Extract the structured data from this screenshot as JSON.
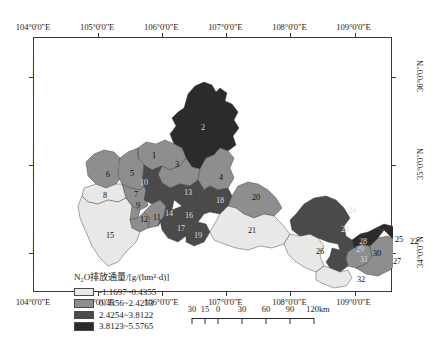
{
  "figure": {
    "domain": "map",
    "title_visible": false
  },
  "axes": {
    "longitude_labels": [
      "104°0'0\"E",
      "105°0'0\"E",
      "106°0'0\"E",
      "107°0'0\"E",
      "108°0'0\"E",
      "109°0'0\"E"
    ],
    "longitude_values": [
      104,
      105,
      106,
      107,
      108,
      109
    ],
    "latitude_labels": [
      "36°0'0\"N",
      "35°0'0\"N",
      "34°0'0\"N"
    ],
    "latitude_values": [
      36,
      35,
      34
    ],
    "lon_range": [
      103.75,
      109.35
    ],
    "lat_range": [
      33.55,
      36.45
    ]
  },
  "legend": {
    "title": "N₂O排放通量/[g/(hm²·d)]",
    "title_parts": {
      "species": "N2O",
      "quantity": "排放通量",
      "unit": "g/(hm2·d)"
    },
    "classes": [
      {
        "label": "-1.1697~0.4355",
        "min": -1.1697,
        "max": 0.4355,
        "color": "#e8e8e6"
      },
      {
        "label": "0.4356~2.4253",
        "min": 0.4356,
        "max": 2.4253,
        "color": "#8e8e8e"
      },
      {
        "label": "2.4254~3.8122",
        "min": 2.4254,
        "max": 3.8122,
        "color": "#4a4a4a"
      },
      {
        "label": "3.8123~5.5765",
        "min": 3.8123,
        "max": 5.5765,
        "color": "#2b2b2b"
      }
    ]
  },
  "scalebar": {
    "labels": [
      "30",
      "15",
      "0",
      "30",
      "60",
      "90",
      "120km"
    ],
    "values": [
      30,
      15,
      0,
      30,
      60,
      90,
      120
    ],
    "unit": "km"
  },
  "regions": [
    {
      "id": 1,
      "label": "1",
      "class": 1,
      "x": 120,
      "y": 118
    },
    {
      "id": 2,
      "label": "2",
      "class": 3,
      "x": 169,
      "y": 90
    },
    {
      "id": 3,
      "label": "3",
      "class": 1,
      "x": 143,
      "y": 127
    },
    {
      "id": 4,
      "label": "4",
      "class": 1,
      "x": 187,
      "y": 140
    },
    {
      "id": 5,
      "label": "5",
      "class": 1,
      "x": 98,
      "y": 136
    },
    {
      "id": 6,
      "label": "6",
      "class": 1,
      "x": 74,
      "y": 137
    },
    {
      "id": 7,
      "label": "7",
      "class": 1,
      "x": 102,
      "y": 157
    },
    {
      "id": 8,
      "label": "8",
      "class": 0,
      "x": 71,
      "y": 158
    },
    {
      "id": 9,
      "label": "9",
      "class": 1,
      "x": 104,
      "y": 168
    },
    {
      "id": 10,
      "label": "10",
      "class": 2,
      "x": 110,
      "y": 145
    },
    {
      "id": 11,
      "label": "11",
      "class": 1,
      "x": 123,
      "y": 180
    },
    {
      "id": 12,
      "label": "12",
      "class": 1,
      "x": 110,
      "y": 182
    },
    {
      "id": 13,
      "label": "13",
      "class": 2,
      "x": 154,
      "y": 155
    },
    {
      "id": 14,
      "label": "14",
      "class": 2,
      "x": 135,
      "y": 176
    },
    {
      "id": 15,
      "label": "15",
      "class": 0,
      "x": 76,
      "y": 198
    },
    {
      "id": 16,
      "label": "16",
      "class": 2,
      "x": 155,
      "y": 178
    },
    {
      "id": 17,
      "label": "17",
      "class": 2,
      "x": 147,
      "y": 191
    },
    {
      "id": 18,
      "label": "18",
      "class": 2,
      "x": 186,
      "y": 163
    },
    {
      "id": 19,
      "label": "19",
      "class": 2,
      "x": 164,
      "y": 198
    },
    {
      "id": 20,
      "label": "20",
      "class": 1,
      "x": 222,
      "y": 160
    },
    {
      "id": 21,
      "label": "21",
      "class": 0,
      "x": 218,
      "y": 193
    },
    {
      "id": 22,
      "label": "22",
      "class": 3,
      "x": 380,
      "y": 204
    },
    {
      "id": 23,
      "label": "23",
      "class": 2,
      "x": 311,
      "y": 192
    },
    {
      "id": 24,
      "label": "24",
      "class": 2,
      "x": 318,
      "y": 173
    },
    {
      "id": 25,
      "label": "25",
      "class": 3,
      "x": 365,
      "y": 202
    },
    {
      "id": 26,
      "label": "26",
      "class": 0,
      "x": 286,
      "y": 214
    },
    {
      "id": 27,
      "label": "27",
      "class": 1,
      "x": 363,
      "y": 224
    },
    {
      "id": 28,
      "label": "28",
      "class": 2,
      "x": 329,
      "y": 204
    },
    {
      "id": 29,
      "label": "29",
      "class": 2,
      "x": 326,
      "y": 212
    },
    {
      "id": 30,
      "label": "30",
      "class": 1,
      "x": 343,
      "y": 216
    },
    {
      "id": 31,
      "label": "31",
      "class": 2,
      "x": 330,
      "y": 222
    },
    {
      "id": 32,
      "label": "32",
      "class": 0,
      "x": 327,
      "y": 242
    }
  ]
}
